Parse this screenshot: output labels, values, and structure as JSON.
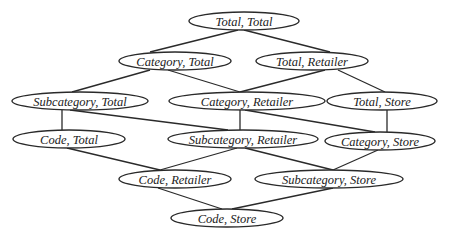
{
  "diagram": {
    "type": "lattice",
    "nodes": [
      {
        "id": "n0",
        "label": "Total, Total",
        "cx": 244,
        "cy": 21,
        "rx": 55,
        "ry": 9
      },
      {
        "id": "n1",
        "label": "Category, Total",
        "cx": 175,
        "cy": 61,
        "rx": 56,
        "ry": 9
      },
      {
        "id": "n2",
        "label": "Total, Retailer",
        "cx": 312,
        "cy": 61,
        "rx": 56,
        "ry": 9
      },
      {
        "id": "n3",
        "label": "Subcategory, Total",
        "cx": 80,
        "cy": 101,
        "rx": 68,
        "ry": 9
      },
      {
        "id": "n4",
        "label": "Category, Retailer",
        "cx": 247,
        "cy": 101,
        "rx": 78,
        "ry": 9
      },
      {
        "id": "n5",
        "label": "Total, Store",
        "cx": 382,
        "cy": 101,
        "rx": 55,
        "ry": 9
      },
      {
        "id": "n6",
        "label": "Code, Total",
        "cx": 69,
        "cy": 139,
        "rx": 56,
        "ry": 9
      },
      {
        "id": "n7",
        "label": "Subcategory, Retailer",
        "cx": 243,
        "cy": 139,
        "rx": 75,
        "ry": 9
      },
      {
        "id": "n8",
        "label": "Category, Store",
        "cx": 380,
        "cy": 141,
        "rx": 55,
        "ry": 9
      },
      {
        "id": "n9",
        "label": "Code, Retailer",
        "cx": 175,
        "cy": 179,
        "rx": 56,
        "ry": 9
      },
      {
        "id": "n10",
        "label": "Subcategory, Store",
        "cx": 329,
        "cy": 179,
        "rx": 74,
        "ry": 9
      },
      {
        "id": "n11",
        "label": "Code, Store",
        "cx": 227,
        "cy": 218,
        "rx": 56,
        "ry": 9
      }
    ],
    "edges": [
      {
        "from": "n0",
        "to": "n1",
        "x1": 238,
        "y1": 30,
        "x2": 150,
        "y2": 52
      },
      {
        "from": "n0",
        "to": "n2",
        "x1": 244,
        "y1": 30,
        "x2": 330,
        "y2": 52
      },
      {
        "from": "n1",
        "to": "n3",
        "x1": 150,
        "y1": 70,
        "x2": 72,
        "y2": 92
      },
      {
        "from": "n1",
        "to": "n4",
        "x1": 168,
        "y1": 70,
        "x2": 240,
        "y2": 92
      },
      {
        "from": "n2",
        "to": "n4",
        "x1": 325,
        "y1": 70,
        "x2": 240,
        "y2": 92
      },
      {
        "from": "n2",
        "to": "n5",
        "x1": 338,
        "y1": 70,
        "x2": 385,
        "y2": 92
      },
      {
        "from": "n3",
        "to": "n6",
        "x1": 62,
        "y1": 110,
        "x2": 62,
        "y2": 130
      },
      {
        "from": "n3",
        "to": "n7",
        "x1": 70,
        "y1": 110,
        "x2": 228,
        "y2": 130
      },
      {
        "from": "n4",
        "to": "n7",
        "x1": 240,
        "y1": 110,
        "x2": 240,
        "y2": 130
      },
      {
        "from": "n4",
        "to": "n8",
        "x1": 245,
        "y1": 110,
        "x2": 375,
        "y2": 132
      },
      {
        "from": "n5",
        "to": "n8",
        "x1": 387,
        "y1": 110,
        "x2": 387,
        "y2": 132
      },
      {
        "from": "n6",
        "to": "n9",
        "x1": 67,
        "y1": 148,
        "x2": 160,
        "y2": 170
      },
      {
        "from": "n7",
        "to": "n9",
        "x1": 237,
        "y1": 148,
        "x2": 160,
        "y2": 170
      },
      {
        "from": "n7",
        "to": "n10",
        "x1": 245,
        "y1": 148,
        "x2": 333,
        "y2": 170
      },
      {
        "from": "n8",
        "to": "n10",
        "x1": 378,
        "y1": 150,
        "x2": 333,
        "y2": 170
      },
      {
        "from": "n9",
        "to": "n11",
        "x1": 158,
        "y1": 188,
        "x2": 222,
        "y2": 209
      },
      {
        "from": "n10",
        "to": "n11",
        "x1": 333,
        "y1": 188,
        "x2": 232,
        "y2": 209
      }
    ]
  }
}
